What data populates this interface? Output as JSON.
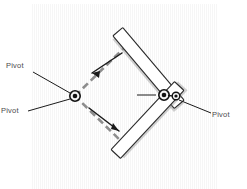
{
  "figure": {
    "type": "mechanical-linkage-diagram",
    "title": "",
    "background": {
      "name": "quilt-block-grid",
      "grid_rows": 3,
      "grid_cols": 3,
      "colors": {
        "light": "#f2f2f2",
        "mid": "#e3e3e3",
        "dark": "#cfcfcf",
        "seam": "#ffffff"
      },
      "block_size_px": 62,
      "origin_x_px": 31,
      "origin_y_px": 4
    },
    "labels": {
      "top_left": "Pivot",
      "bottom_left": "Pivot",
      "right": "Pivot"
    },
    "pivots": [
      {
        "name": "left-pivot",
        "x": 75,
        "y": 96,
        "outer_r": 5.2,
        "inner_r": 2.4
      },
      {
        "name": "right-pivot",
        "x": 163,
        "y": 95,
        "outer_r": 5.2,
        "inner_r": 2.4
      },
      {
        "name": "right-secondary-pin",
        "x": 175,
        "y": 96,
        "outer_r": 3.6,
        "inner_r": 1.6
      }
    ],
    "bars": [
      {
        "name": "upper-linkage-bar",
        "x1": 119,
        "y1": 33,
        "x2": 178,
        "y2": 103,
        "width": 13
      },
      {
        "name": "lower-linkage-bar",
        "x1": 118,
        "y1": 152,
        "x2": 177,
        "y2": 88,
        "width": 13
      }
    ],
    "motion_arrows": [
      {
        "name": "upper-motion-arrow",
        "from_x": 121,
        "from_y": 54,
        "to_x": 88,
        "to_y": 76,
        "direction": "up-left"
      },
      {
        "name": "lower-motion-arrow",
        "from_x": 88,
        "from_y": 110,
        "to_x": 120,
        "to_y": 135,
        "direction": "down-right"
      }
    ],
    "dashed_path": {
      "name": "motion-envelope-path",
      "points": "75,96 124,48 170,94 124,144 75,96",
      "color": "#8d8d8d"
    },
    "leader_lines": [
      {
        "name": "leader-top-left",
        "x1": 34,
        "y1": 74,
        "x2": 71,
        "y2": 94
      },
      {
        "name": "leader-bottom-left",
        "x1": 30,
        "y1": 111,
        "x2": 71,
        "y2": 98
      },
      {
        "name": "leader-right",
        "x1": 211,
        "y1": 113,
        "x2": 178,
        "y2": 99
      },
      {
        "name": "leader-center-short",
        "x1": 138,
        "y1": 95,
        "x2": 156,
        "y2": 95
      }
    ],
    "stroke_colors": {
      "outline": "#111111",
      "leader": "#1a1a1a",
      "bar_fill": "#ffffff",
      "bar_edge": "#2b2b2b",
      "bar_shadow": "#9a9a9a"
    }
  }
}
